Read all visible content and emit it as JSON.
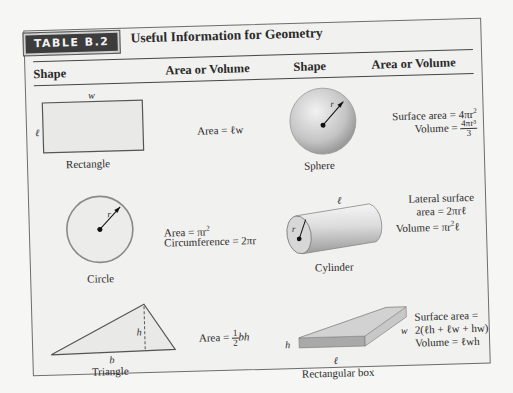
{
  "table": {
    "badge": "TABLE B.2",
    "title": "Useful Information for Geometry",
    "headers": [
      "Shape",
      "Area or Volume",
      "Shape",
      "Area or Volume"
    ]
  },
  "rows": [
    {
      "left": {
        "shape": "Rectangle",
        "dim_labels": {
          "width": "w",
          "length": "ℓ"
        },
        "formulas": [
          "Area = ℓw"
        ]
      },
      "right": {
        "shape": "Sphere",
        "dim_labels": {
          "radius": "r"
        },
        "formulas": [
          "Surface area = 4πr²",
          "Volume = 4πr³/3"
        ],
        "volume_prefix": "Volume = ",
        "volume_num": "4πr³",
        "volume_den": "3",
        "surface_prefix": "Surface area = 4πr",
        "surface_exp": "2"
      }
    },
    {
      "left": {
        "shape": "Circle",
        "dim_labels": {
          "radius": "r"
        },
        "formulas": [
          "Area = πr²",
          "Circumference = 2πr"
        ],
        "area_prefix": "Area = πr",
        "area_exp": "2"
      },
      "right": {
        "shape": "Cylinder",
        "dim_labels": {
          "length": "ℓ",
          "radius": "r"
        },
        "formulas": [
          "Lateral surface",
          "area = 2πrℓ",
          "Volume = πr²ℓ"
        ],
        "volume_prefix": "Volume = πr",
        "volume_exp": "2",
        "volume_suffix": "ℓ"
      }
    },
    {
      "left": {
        "shape": "Triangle",
        "dim_labels": {
          "base": "b",
          "height": "h"
        },
        "formulas": [
          "Area = ½bh"
        ],
        "area_prefix": "Area = ",
        "area_num": "1",
        "area_den": "2",
        "area_suffix": "bh"
      },
      "right": {
        "shape": "Rectangular box",
        "dim_labels": {
          "height": "h",
          "length": "ℓ",
          "width": "w"
        },
        "formulas": [
          "Surface area =",
          "2(ℓh + ℓw + hw)",
          "Volume = ℓwh"
        ]
      }
    }
  ]
}
